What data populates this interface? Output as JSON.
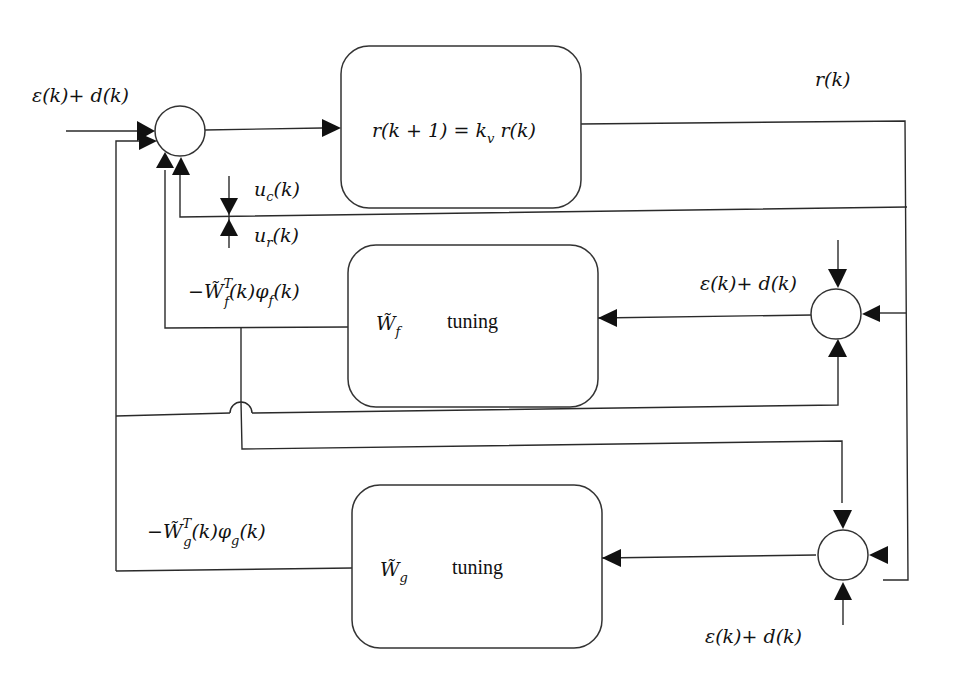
{
  "diagram": {
    "colors": {
      "line": "#2a2a2a",
      "arrow": "#111111",
      "background": "#ffffff"
    },
    "labels": {
      "input_disturbance": "ε(k)+ d(k)",
      "output": "r(k)",
      "plant_equation": {
        "lhs": "r(k + 1) = k",
        "sub": "v",
        "rhs": " r(k)"
      },
      "uc": {
        "base": "u",
        "sub": "c",
        "tail": "(k)"
      },
      "ur": {
        "base": "u",
        "sub": "r",
        "tail": "(k)"
      },
      "wf_feedback": {
        "pre": "−W̃",
        "sup": "T",
        "sub": "f",
        "mid": "(k)φ",
        "sub2": "f",
        "tail": "(k)"
      },
      "wg_feedback": {
        "pre": "−W̃",
        "sup": "T",
        "sub": "g",
        "mid": "(k)φ",
        "sub2": "g",
        "tail": "(k)"
      },
      "wf_block": {
        "symbol": "W̃",
        "sub": "f",
        "text": "tuning"
      },
      "wg_block": {
        "symbol": "W̃",
        "sub": "g",
        "text": "tuning"
      },
      "sum_f_disturbance": "ε(k)+ d(k)",
      "sum_g_disturbance": "ε(k)+ d(k)"
    },
    "blocks": [
      {
        "id": "plant",
        "label": "r(k+1) = k_v r(k)"
      },
      {
        "id": "wf-tuning",
        "label": "W̃_f tuning"
      },
      {
        "id": "wg-tuning",
        "label": "W̃_g tuning"
      }
    ],
    "summing_junctions": [
      {
        "id": "main-sum"
      },
      {
        "id": "wf-sum"
      },
      {
        "id": "wg-sum"
      }
    ]
  }
}
